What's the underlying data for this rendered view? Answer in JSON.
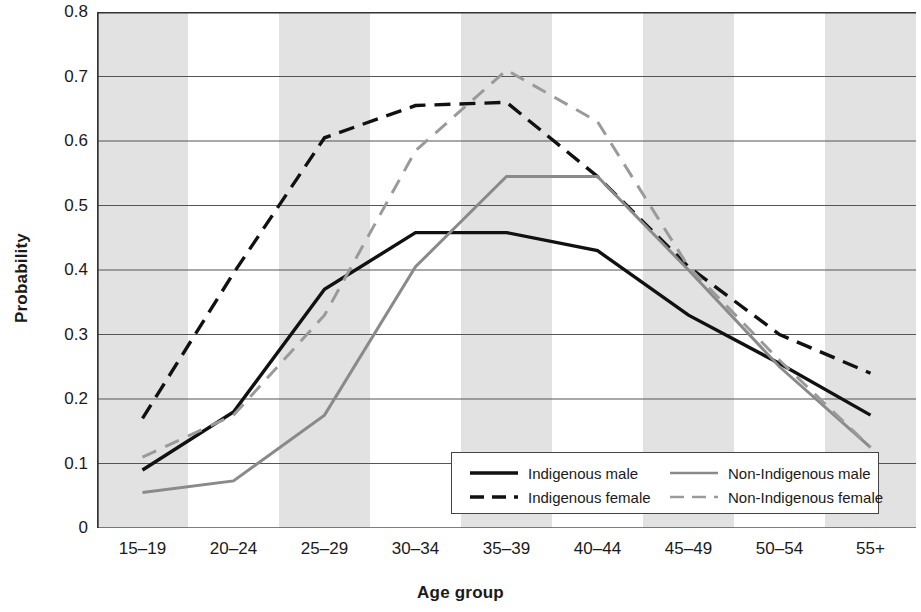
{
  "chart_data": {
    "type": "line",
    "title": "",
    "xlabel": "Age group",
    "ylabel": "Probability",
    "categories": [
      "15–19",
      "20–24",
      "25–29",
      "30–34",
      "35–39",
      "40–44",
      "45–49",
      "50–54",
      "55+"
    ],
    "ylim": [
      0,
      0.8
    ],
    "yticks": [
      "0.8",
      "0.7",
      "0.6",
      "0.5",
      "0.4",
      "0.3",
      "0.2",
      "0.1",
      "0"
    ],
    "ytick_values": [
      0.8,
      0.7,
      0.6,
      0.5,
      0.4,
      0.3,
      0.2,
      0.1,
      0
    ],
    "grid": true,
    "legend_position": "inside-bottom-center",
    "banding": "alternating vertical grey bands per category",
    "series": [
      {
        "name": "Indigenous male",
        "color": "#111111",
        "style": "solid",
        "width": 3.4,
        "values": [
          0.09,
          0.18,
          0.37,
          0.458,
          0.458,
          0.43,
          0.33,
          0.255,
          0.175
        ]
      },
      {
        "name": "Indigenous female",
        "color": "#111111",
        "style": "dashed",
        "width": 3.4,
        "values": [
          0.17,
          0.395,
          0.605,
          0.655,
          0.66,
          0.545,
          0.405,
          0.3,
          0.24
        ]
      },
      {
        "name": "Non-Indigenous male",
        "color": "#8a8a8a",
        "style": "solid",
        "width": 3.0,
        "values": [
          0.055,
          0.073,
          0.175,
          0.405,
          0.545,
          0.545,
          0.4,
          0.25,
          0.125
        ]
      },
      {
        "name": "Non-Indigenous female",
        "color": "#9a9a9a",
        "style": "dashed",
        "width": 3.0,
        "values": [
          0.11,
          0.175,
          0.33,
          0.585,
          0.71,
          0.63,
          0.405,
          0.26,
          0.125
        ]
      }
    ]
  },
  "legend": {
    "items": [
      {
        "label": "Indigenous male",
        "color": "#111111",
        "style": "solid"
      },
      {
        "label": "Indigenous female",
        "color": "#111111",
        "style": "dashed"
      },
      {
        "label": "Non-Indigenous male",
        "color": "#8a8a8a",
        "style": "solid"
      },
      {
        "label": "Non-Indigenous female",
        "color": "#9a9a9a",
        "style": "dashed"
      }
    ]
  },
  "colors": {
    "indigenous": "#111111",
    "non_indigenous": "#8a8a8a",
    "band": "#e2e2e2",
    "grid": "#555555",
    "axis": "#333333",
    "background": "#ffffff"
  }
}
